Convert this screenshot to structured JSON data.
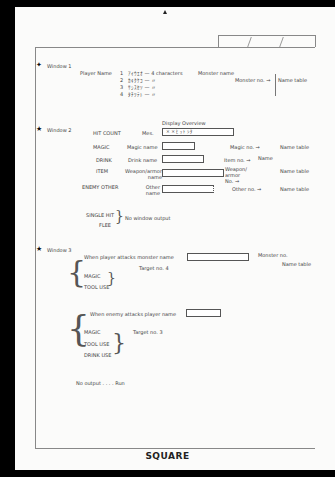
{
  "brand": "SQUARE",
  "window1": {
    "label": "Window 1",
    "field_label": "Player Name",
    "rows": [
      {
        "num": "1",
        "text": "ｱｲｳｴｵ — 4 characters"
      },
      {
        "num": "2",
        "text": "ｶｷｸｹｺ — 〃"
      },
      {
        "num": "3",
        "text": "ｻｼｽｾｿ — 〃"
      },
      {
        "num": "4",
        "text": "ﾀﾁﾂﾃﾄ — 〃"
      }
    ],
    "monster_label": "Monster name",
    "monster_no": "Monster no. →",
    "name_table": "Name table"
  },
  "window2": {
    "label": "Window 2",
    "overview_title": "Display Overview",
    "rows": [
      {
        "category": "HIT COUNT",
        "field": "Mes.",
        "ref": "",
        "table": ""
      },
      {
        "category": "MAGIC",
        "field": "Magic name",
        "ref": "Magic no. →",
        "table": "Name table"
      },
      {
        "category": "DRINK",
        "field": "Drink name",
        "ref": "Item no. →",
        "table": "Name"
      },
      {
        "category": "ITEM",
        "field": "Weapon/armor name",
        "ref": "Weapon/ armor No. →",
        "table": "Name table"
      },
      {
        "category": "ENEMY OTHER",
        "field": "Other name",
        "ref": "Other no. →",
        "table": "Name table"
      }
    ],
    "hit_count_chars": "× ×  ﾋ ｯ ﾄ ｼ ﾀ",
    "no_output_items": [
      "SINGLE HIT",
      "FLEE"
    ],
    "no_output_label": "No window output"
  },
  "window3": {
    "label": "Window 3",
    "player_attack": {
      "title": "When player attacks monster name",
      "items": [
        "MAGIC",
        "TOOL USE"
      ],
      "target": "Target no. 4",
      "monster_no": "Monster no.",
      "name_table": "Name table"
    },
    "enemy_attack": {
      "title": "When enemy attacks player name",
      "items": [
        "MAGIC",
        "TOOL USE",
        "DRINK USE"
      ],
      "target": "Target no. 3"
    },
    "no_output": "No output . . . . Run"
  }
}
